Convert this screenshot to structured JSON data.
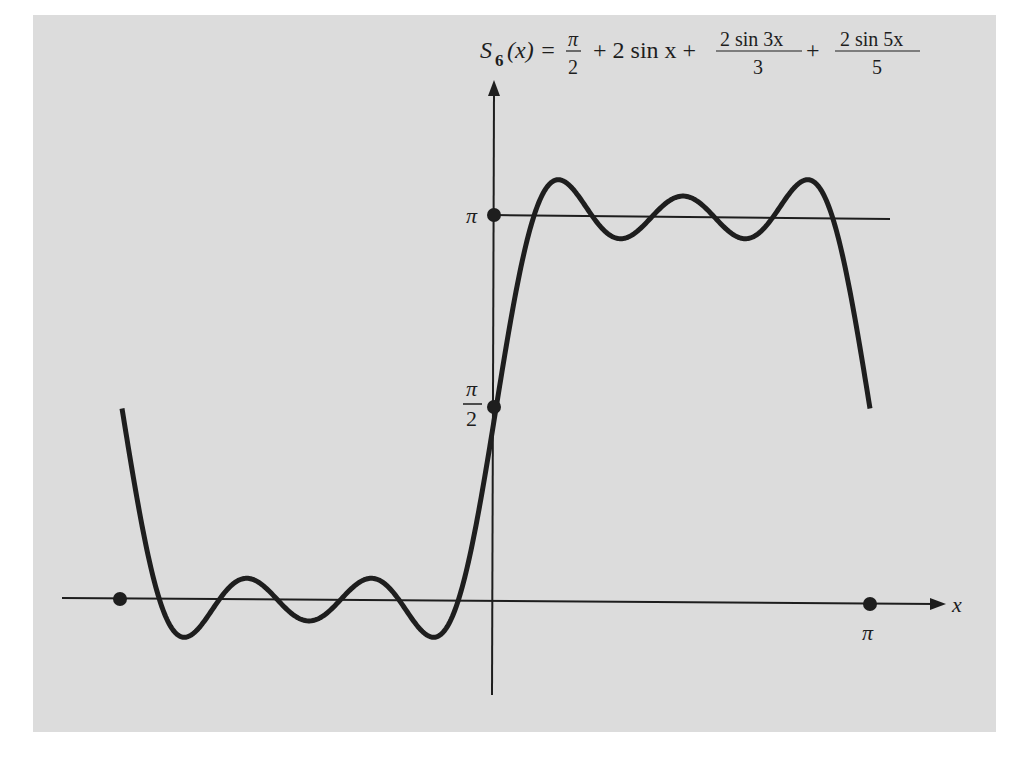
{
  "chart_data": {
    "type": "line",
    "formula": {
      "lhs_symbol": "S",
      "lhs_subscript": "6",
      "lhs_arg": "(x) =",
      "term1_num": "π",
      "term1_den": "2",
      "term2": "+ 2 sin x +",
      "term3_num": "2 sin 3x",
      "term3_den": "3",
      "plus": "+",
      "term4_num": "2 sin 5x",
      "term4_den": "5"
    },
    "series": [
      {
        "name": "S6(x)",
        "expression": "pi/2 + 2*sin(x) + 2*sin(3x)/3 + 2*sin(5x)/5",
        "x_range": [
          -3.14159,
          3.14159
        ],
        "color": "#1e1e1e"
      }
    ],
    "reference_lines": [
      {
        "name": "y = π",
        "y": 3.14159,
        "x_range": [
          0,
          3.3
        ]
      }
    ],
    "marked_points": [
      {
        "x": -3.14159,
        "y": 0,
        "label": ""
      },
      {
        "x": 3.14159,
        "y": 0,
        "label": "π"
      },
      {
        "x": 0,
        "y": 1.5708,
        "label": "π/2"
      },
      {
        "x": 0,
        "y": 3.14159,
        "label": "π"
      }
    ],
    "xlabel": "x",
    "ylabel": "",
    "x_tick_labels": [
      "π"
    ],
    "y_tick_labels": [
      "π/2",
      "π"
    ],
    "xlim": [
      -3.63,
      3.8
    ],
    "ylim": [
      -0.77,
      4.27
    ],
    "grid": false,
    "legend": "none"
  },
  "labels": {
    "x_axis": "x",
    "x_pi": "π",
    "y_pi": "π",
    "y_half_num": "π",
    "y_half_den": "2"
  },
  "colors": {
    "background": "#dcdcdc",
    "ink": "#1e1e1e"
  }
}
